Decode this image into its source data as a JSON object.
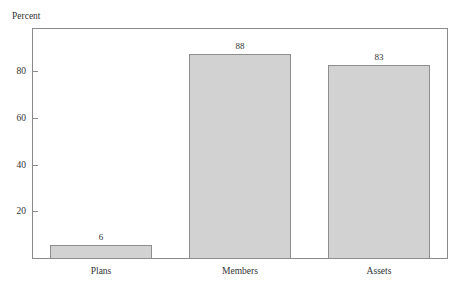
{
  "chart_data": {
    "type": "bar",
    "title": "",
    "ylabel": "Percent",
    "xlabel": "",
    "categories": [
      "Plans",
      "Members",
      "Assets"
    ],
    "values": [
      6,
      88,
      83
    ],
    "value_labels": [
      "6",
      "88",
      "83"
    ],
    "ylim": [
      0,
      99
    ],
    "yticks": [
      20,
      40,
      60,
      80
    ],
    "ytick_labels": [
      "20",
      "40",
      "60",
      "80"
    ],
    "grid": false,
    "legend": false,
    "bar_fill_color": "#d2d2d2",
    "bar_border_color": "#8e8e8e",
    "frame_color": "#8a8a8a",
    "text_color": "#333333"
  }
}
